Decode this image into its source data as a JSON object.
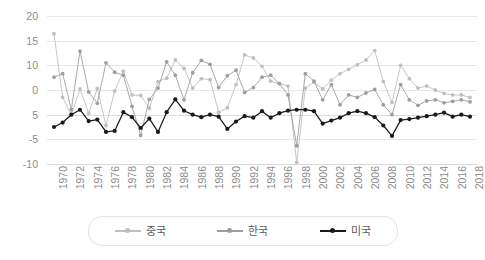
{
  "chart_data": {
    "type": "line",
    "title": "",
    "subtitle": "",
    "xlabel": "",
    "ylabel": "",
    "grid": true,
    "legend_position": "bottom",
    "ylim": [
      -10,
      20
    ],
    "y_ticks_displayed": [
      "20",
      "15",
      "10",
      "0",
      "5",
      "-5",
      "-10"
    ],
    "y_tick_values": [
      20,
      15,
      10,
      5,
      0,
      -5,
      -10
    ],
    "x": [
      1970,
      1971,
      1972,
      1973,
      1974,
      1975,
      1976,
      1977,
      1978,
      1979,
      1980,
      1981,
      1982,
      1983,
      1984,
      1985,
      1986,
      1987,
      1988,
      1989,
      1990,
      1991,
      1992,
      1993,
      1994,
      1995,
      1996,
      1997,
      1998,
      1999,
      2000,
      2001,
      2002,
      2003,
      2004,
      2005,
      2006,
      2007,
      2008,
      2009,
      2010,
      2011,
      2012,
      2013,
      2014,
      2015,
      2016,
      2017,
      2018
    ],
    "x_tick_labels": [
      "1970",
      "1972",
      "1974",
      "1976",
      "1978",
      "1980",
      "1982",
      "1984",
      "1986",
      "1988",
      "1990",
      "1992",
      "1994",
      "1996",
      "1998",
      "2000",
      "2002",
      "2004",
      "2006",
      "2008",
      "2010",
      "2012",
      "2014",
      "2016",
      "2018"
    ],
    "series": [
      {
        "name": "중국",
        "color": "#bfbfbf",
        "marker": "circle",
        "values": [
          16.4,
          3.5,
          0.0,
          5.2,
          0.3,
          5.3,
          -2.2,
          4.8,
          8.8,
          4.0,
          3.9,
          1.3,
          6.7,
          7.4,
          11.1,
          9.4,
          5.4,
          7.3,
          7.1,
          0.5,
          1.4,
          6.1,
          12.1,
          11.5,
          9.8,
          6.8,
          6.3,
          5.8,
          -9.7,
          5.4,
          6.6,
          5.2,
          7.0,
          8.3,
          9.2,
          10.1,
          11.1,
          13.0,
          6.7,
          2.5,
          10.0,
          7.3,
          5.4,
          5.8,
          5.0,
          4.3,
          4.0,
          4.0,
          3.5
        ]
      },
      {
        "name": "한국",
        "color": "#9e9e9e",
        "marker": "circle",
        "values": [
          7.6,
          8.3,
          1.0,
          12.9,
          4.6,
          2.3,
          10.5,
          8.6,
          8.0,
          1.7,
          -4.2,
          3.1,
          5.4,
          10.7,
          8.0,
          3.0,
          8.5,
          11.0,
          10.2,
          5.5,
          7.9,
          9.0,
          4.5,
          5.5,
          7.6,
          8.0,
          6.3,
          4.0,
          -6.3,
          8.3,
          6.8,
          3.0,
          6.1,
          2.0,
          4.0,
          3.5,
          4.4,
          5.1,
          2.0,
          0.0,
          6.1,
          3.0,
          1.9,
          2.8,
          3.0,
          2.4,
          2.7,
          3.0,
          2.6
        ]
      },
      {
        "name": "미국",
        "color": "#1a1a1a",
        "marker": "circle",
        "values": [
          -2.5,
          -1.6,
          0.0,
          1.0,
          -1.3,
          -1.0,
          -3.5,
          -3.3,
          0.5,
          -0.5,
          -2.7,
          -0.8,
          -3.5,
          0.5,
          3.1,
          0.8,
          0.0,
          -0.5,
          0.0,
          -0.4,
          -2.9,
          -1.4,
          -0.3,
          -0.6,
          0.7,
          -0.6,
          0.3,
          0.8,
          1.0,
          1.0,
          0.7,
          -1.8,
          -1.2,
          -0.6,
          0.3,
          0.7,
          0.3,
          -0.5,
          -2.2,
          -4.3,
          -1.1,
          -0.9,
          -0.6,
          -0.3,
          0.0,
          0.4,
          -0.4,
          0.0,
          -0.4
        ]
      }
    ]
  },
  "legend": {
    "items": [
      {
        "label": "중국",
        "color": "#bfbfbf"
      },
      {
        "label": "한국",
        "color": "#9e9e9e"
      },
      {
        "label": "미국",
        "color": "#1a1a1a"
      }
    ]
  }
}
